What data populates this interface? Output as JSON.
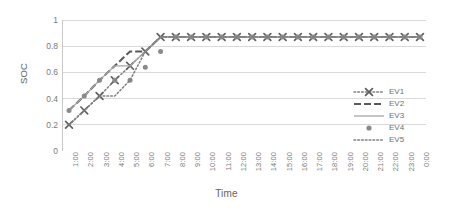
{
  "chart_data": {
    "type": "line",
    "title": "",
    "xlabel": "Time",
    "ylabel": "SOC",
    "ylim": [
      0,
      1
    ],
    "y_ticks": [
      "0",
      "0.2",
      "0.4",
      "0.6",
      "0.8",
      "1"
    ],
    "y_tick_values": [
      0,
      0.2,
      0.4,
      0.6,
      0.8,
      1
    ],
    "grid": true,
    "grid_axis": "y",
    "legend_position": "right",
    "categories": [
      "1:00",
      "2:00",
      "3:00",
      "4:00",
      "5:00",
      "6:00",
      "7:00",
      "8:00",
      "9:00",
      "10:00",
      "11:00",
      "12:00",
      "13:00",
      "14:00",
      "15:00",
      "16:00",
      "17:00",
      "18:00",
      "19:00",
      "20:00",
      "21:00",
      "22:00",
      "23:00",
      "0:00"
    ],
    "series": [
      {
        "name": "EV1",
        "marker": "x",
        "line_style": "dotted",
        "color": "#808080",
        "values": [
          0.2,
          0.31,
          0.42,
          0.54,
          0.65,
          0.76,
          0.87,
          0.87,
          0.87,
          0.87,
          0.87,
          0.87,
          0.87,
          0.87,
          0.87,
          0.87,
          0.87,
          0.87,
          0.87,
          0.87,
          0.87,
          0.87,
          0.87,
          0.87
        ]
      },
      {
        "name": "EV2",
        "marker": "none",
        "line_style": "dashed",
        "color": "#595959",
        "values": [
          0.31,
          0.42,
          0.54,
          0.65,
          0.76,
          0.76,
          0.87,
          0.87,
          0.87,
          0.87,
          0.87,
          0.87,
          0.87,
          0.87,
          0.87,
          0.87,
          0.87,
          0.87,
          0.87,
          0.87,
          0.87,
          0.87,
          0.87,
          0.87
        ]
      },
      {
        "name": "EV3",
        "marker": "none",
        "line_style": "solid",
        "color": "#a6a6a6",
        "values": [
          0.31,
          0.42,
          0.54,
          0.65,
          0.65,
          0.76,
          0.87,
          0.87,
          0.87,
          0.87,
          0.87,
          0.87,
          0.87,
          0.87,
          0.87,
          0.87,
          0.87,
          0.87,
          0.87,
          0.87,
          0.87,
          0.87,
          0.87,
          0.87
        ]
      },
      {
        "name": "EV4",
        "marker": "circle",
        "line_style": "none",
        "color": "#808080",
        "values": [
          0.31,
          0.42,
          0.54,
          0.54,
          0.54,
          0.64,
          0.76,
          0.87,
          0.87,
          0.87,
          0.87,
          0.87,
          0.87,
          0.87,
          0.87,
          0.87,
          0.87,
          0.87,
          0.87,
          0.87,
          0.87,
          0.87,
          0.87,
          0.87
        ]
      },
      {
        "name": "EV5",
        "marker": "none",
        "line_style": "dotted",
        "color": "#7f7f7f",
        "values": [
          0.2,
          0.31,
          0.42,
          0.42,
          0.54,
          0.76,
          0.87,
          0.87,
          0.87,
          0.87,
          0.87,
          0.87,
          0.87,
          0.87,
          0.87,
          0.87,
          0.87,
          0.87,
          0.87,
          0.87,
          0.87,
          0.87,
          0.87,
          0.87
        ]
      }
    ],
    "legend_entries": [
      "EV1",
      "EV2",
      "EV3",
      "EV4",
      "EV5"
    ]
  },
  "colors": {
    "grid": "#d9d9d9",
    "axis": "#c8c8c8",
    "tick_text": "#7a7a7a",
    "title_text": "#636363",
    "legend_border": "#d9d9d9"
  }
}
